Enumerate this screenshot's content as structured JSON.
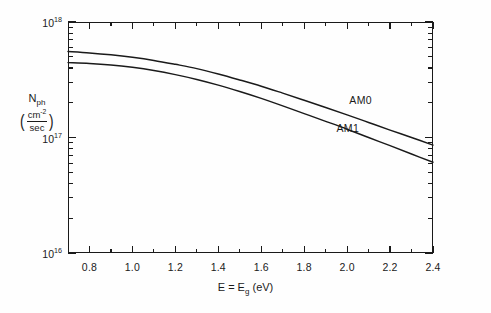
{
  "chart_data": {
    "type": "line",
    "title": "",
    "subtitle": "",
    "xlabel": "E = E_g (eV)",
    "ylabel": "N_ph (cm^-2/sec)",
    "xscale": "linear",
    "yscale": "log",
    "xlim": [
      0.7,
      2.4
    ],
    "ylim": [
      1e+16,
      1e+18
    ],
    "grid": false,
    "legend_position": "inline-right",
    "x_major_ticks": [
      0.8,
      1.0,
      1.2,
      1.4,
      1.6,
      1.8,
      2.0,
      2.2,
      2.4
    ],
    "x_major_tick_labels": [
      "0.8",
      "1.0",
      "1.2",
      "1.4",
      "1.6",
      "1.8",
      "2.0",
      "2.2",
      "2.4"
    ],
    "x_minor_ticks": [
      0.7,
      0.9,
      1.1,
      1.3,
      1.5,
      1.7,
      1.9,
      2.1,
      2.3
    ],
    "y_major_ticks": [
      1e+16,
      1e+17,
      1e+18
    ],
    "y_major_tick_labels": [
      "10^16",
      "10^17",
      "10^18"
    ],
    "y_tick_mantissa": "10",
    "y_tick_exponents": [
      "18",
      "17",
      "16"
    ],
    "series": [
      {
        "name": "AM0",
        "label": "AM0",
        "color": "#1a1a1a",
        "x": [
          0.7,
          0.8,
          0.9,
          1.0,
          1.1,
          1.2,
          1.3,
          1.4,
          1.5,
          1.6,
          1.7,
          1.8,
          1.9,
          2.0,
          2.1,
          2.2,
          2.3,
          2.4
        ],
        "y": [
          5.55e+17,
          5.4e+17,
          5.2e+17,
          4.95e+17,
          4.65e+17,
          4.3e+17,
          3.95e+17,
          3.55e+17,
          3.15e+17,
          2.78e+17,
          2.42e+17,
          2.1e+17,
          1.82e+17,
          1.57e+17,
          1.35e+17,
          1.16e+17,
          1e+17,
          8.6e+16
        ]
      },
      {
        "name": "AM1",
        "label": "AM1",
        "color": "#1a1a1a",
        "x": [
          0.7,
          0.8,
          0.9,
          1.0,
          1.1,
          1.2,
          1.3,
          1.4,
          1.5,
          1.6,
          1.7,
          1.8,
          1.9,
          2.0,
          2.1,
          2.2,
          2.3,
          2.4
        ],
        "y": [
          4.45e+17,
          4.38e+17,
          4.25e+17,
          4.05e+17,
          3.8e+17,
          3.5e+17,
          3.18e+17,
          2.84e+17,
          2.5e+17,
          2.18e+17,
          1.88e+17,
          1.61e+17,
          1.38e+17,
          1.18e+17,
          1e+17,
          8.5e+16,
          7.2e+16,
          6.1e+16
        ]
      }
    ],
    "annotations": [
      {
        "text": "AM0",
        "x": 2.01,
        "y": 2.05e+17
      },
      {
        "text": "AM1",
        "x": 1.95,
        "y": 1.18e+17
      }
    ]
  },
  "axis": {
    "y_title_symbol": "N",
    "y_title_subscript": "ph",
    "y_units_numerator": "cm",
    "y_units_numerator_exponent": "-2",
    "y_units_denominator": "sec",
    "x_title_lead": "E = E",
    "x_title_subscript": "g",
    "x_title_unit": "(eV)"
  }
}
